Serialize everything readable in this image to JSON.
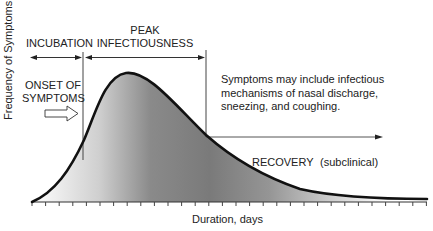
{
  "diagram": {
    "y_axis_label": "Frequency of Symptoms",
    "x_axis_label": "Duration, days",
    "phases": {
      "incubation": "INCUBATION",
      "peak_line1": "PEAK",
      "peak_line2": "INFECTIOUSNESS",
      "recovery": "RECOVERY",
      "recovery_note": "(subclinical)"
    },
    "onset": {
      "line1": "ONSET OF",
      "line2": "SYMPTOMS"
    },
    "symptoms_note": "Symptoms may include infectious mechanisms of nasal discharge, sneezing, and coughing.",
    "tick_count": 30,
    "colors": {
      "curve": "#111111",
      "fill_dark": "#7d7d7d",
      "fill_light": "#ffffff",
      "lines": "#333333"
    }
  }
}
